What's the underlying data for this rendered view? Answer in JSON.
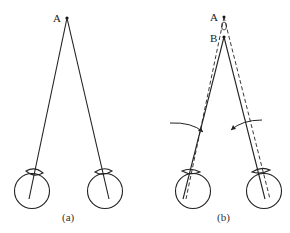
{
  "figure": {
    "panels": [
      {
        "id": "a",
        "caption": "(a)",
        "points": [
          {
            "label": "A"
          }
        ],
        "description": "Both eyes fixate on point A; solid lines of sight from A to each eye"
      },
      {
        "id": "b",
        "caption": "(b)",
        "points": [
          {
            "label": "A"
          },
          {
            "label": "B"
          }
        ],
        "description": "Eyes converge inward (curved arrows) to fixate nearer point B; solid lines to B, dashed lines to A"
      }
    ],
    "colors": {
      "line": "#222222",
      "background": "#ffffff"
    }
  }
}
